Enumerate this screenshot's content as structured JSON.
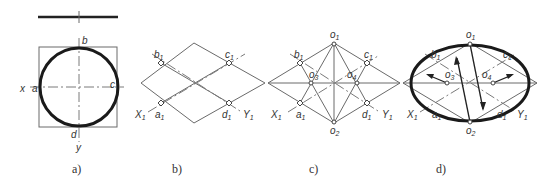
{
  "figure": {
    "panels": [
      {
        "id": "a",
        "caption": "a)",
        "labels": {
          "top": "b",
          "left": "a",
          "right": "c",
          "bottom": "d",
          "x_axis": "x",
          "y_axis": "y"
        }
      },
      {
        "id": "b",
        "caption": "b)",
        "labels": {
          "b1": "b",
          "c1": "c",
          "a1": "a",
          "d1": "d",
          "X1": "X",
          "Y1": "Y",
          "sub": "1"
        }
      },
      {
        "id": "c",
        "caption": "c)",
        "labels": {
          "o1": "o",
          "o2": "o",
          "o3": "o",
          "o4": "o",
          "b1": "b",
          "c1": "c",
          "a1": "a",
          "d1": "d",
          "X1": "X",
          "Y1": "Y",
          "sub1": "1",
          "sub2": "2",
          "sub3": "3",
          "sub4": "4"
        }
      },
      {
        "id": "d",
        "caption": "d)",
        "labels": {
          "o1": "o",
          "o2": "o",
          "o3": "o",
          "o4": "o",
          "b1": "b",
          "c1": "c",
          "a1": "a",
          "d1": "d",
          "X1": "X",
          "Y1": "Y",
          "sub1": "1",
          "sub2": "2",
          "sub3": "3",
          "sub4": "4"
        }
      }
    ]
  }
}
